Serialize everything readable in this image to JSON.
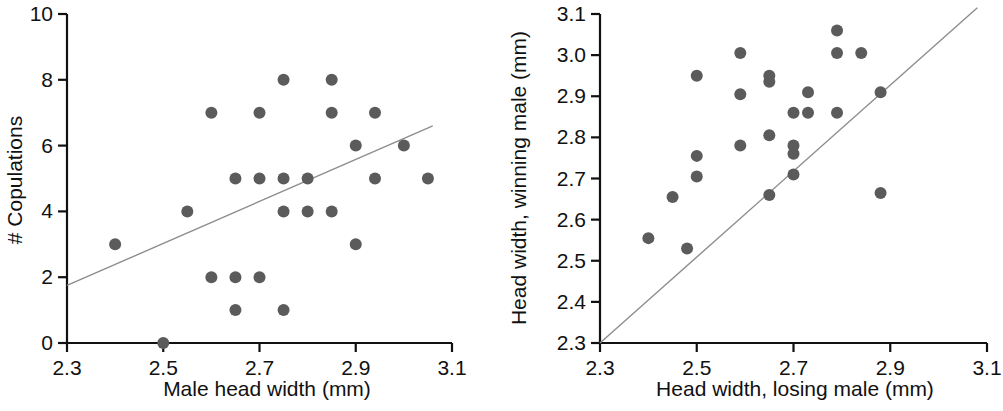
{
  "figure": {
    "background": "#ffffff",
    "marker_color": "#5b5b5b",
    "line_color": "#8d8d8d",
    "axis_color": "#111111",
    "panel_count": 2
  },
  "chart_data": [
    {
      "type": "scatter",
      "panel": "left",
      "title": "",
      "xlabel": "Male head width (mm)",
      "ylabel": "# Copulations",
      "xlim": [
        2.3,
        3.1
      ],
      "ylim": [
        0,
        10
      ],
      "xticks": [
        2.3,
        2.5,
        2.7,
        2.9,
        3.1
      ],
      "xticklabels": [
        "2.3",
        "2.5",
        "2.7",
        "2.9",
        "3.1"
      ],
      "yticks": [
        0,
        2,
        4,
        6,
        8,
        10
      ],
      "yticklabels": [
        "0",
        "2",
        "4",
        "6",
        "8",
        "10"
      ],
      "grid": false,
      "legend": null,
      "points": [
        {
          "x": 2.4,
          "y": 3
        },
        {
          "x": 2.5,
          "y": 0
        },
        {
          "x": 2.55,
          "y": 4
        },
        {
          "x": 2.6,
          "y": 7
        },
        {
          "x": 2.6,
          "y": 2
        },
        {
          "x": 2.65,
          "y": 5
        },
        {
          "x": 2.65,
          "y": 2
        },
        {
          "x": 2.65,
          "y": 1
        },
        {
          "x": 2.7,
          "y": 7
        },
        {
          "x": 2.7,
          "y": 5
        },
        {
          "x": 2.7,
          "y": 2
        },
        {
          "x": 2.75,
          "y": 8
        },
        {
          "x": 2.75,
          "y": 5
        },
        {
          "x": 2.75,
          "y": 4
        },
        {
          "x": 2.75,
          "y": 1
        },
        {
          "x": 2.8,
          "y": 5
        },
        {
          "x": 2.8,
          "y": 4
        },
        {
          "x": 2.85,
          "y": 8
        },
        {
          "x": 2.85,
          "y": 7
        },
        {
          "x": 2.85,
          "y": 4
        },
        {
          "x": 2.9,
          "y": 6
        },
        {
          "x": 2.9,
          "y": 3
        },
        {
          "x": 2.94,
          "y": 7
        },
        {
          "x": 2.94,
          "y": 5
        },
        {
          "x": 3.0,
          "y": 6
        },
        {
          "x": 3.05,
          "y": 5
        }
      ],
      "fit_line": {
        "x1": 2.3,
        "y1": 1.75,
        "x2": 3.06,
        "y2": 6.6
      }
    },
    {
      "type": "scatter",
      "panel": "right",
      "title": "",
      "xlabel": "Head width, losing male (mm)",
      "ylabel": "Head width, winning male (mm)",
      "xlim": [
        2.3,
        3.1
      ],
      "ylim": [
        2.3,
        3.1
      ],
      "xticks": [
        2.3,
        2.5,
        2.7,
        2.9,
        3.1
      ],
      "xticklabels": [
        "2.3",
        "2.5",
        "2.7",
        "2.9",
        "3.1"
      ],
      "yticks": [
        2.3,
        2.4,
        2.5,
        2.6,
        2.7,
        2.8,
        2.9,
        3.0,
        3.1
      ],
      "yticklabels": [
        "2.3",
        "2.4",
        "2.5",
        "2.6",
        "2.7",
        "2.8",
        "2.9",
        "3.0",
        "3.1"
      ],
      "grid": false,
      "legend": null,
      "points": [
        {
          "x": 2.4,
          "y": 2.555
        },
        {
          "x": 2.45,
          "y": 2.655
        },
        {
          "x": 2.48,
          "y": 2.53
        },
        {
          "x": 2.5,
          "y": 2.95
        },
        {
          "x": 2.5,
          "y": 2.755
        },
        {
          "x": 2.5,
          "y": 2.705
        },
        {
          "x": 2.59,
          "y": 3.005
        },
        {
          "x": 2.59,
          "y": 2.905
        },
        {
          "x": 2.59,
          "y": 2.78
        },
        {
          "x": 2.65,
          "y": 2.95
        },
        {
          "x": 2.65,
          "y": 2.935
        },
        {
          "x": 2.65,
          "y": 2.805
        },
        {
          "x": 2.65,
          "y": 2.66
        },
        {
          "x": 2.7,
          "y": 2.86
        },
        {
          "x": 2.7,
          "y": 2.78
        },
        {
          "x": 2.7,
          "y": 2.76
        },
        {
          "x": 2.7,
          "y": 2.71
        },
        {
          "x": 2.73,
          "y": 2.91
        },
        {
          "x": 2.73,
          "y": 2.86
        },
        {
          "x": 2.79,
          "y": 3.06
        },
        {
          "x": 2.79,
          "y": 3.005
        },
        {
          "x": 2.79,
          "y": 2.86
        },
        {
          "x": 2.84,
          "y": 3.005
        },
        {
          "x": 2.88,
          "y": 2.91
        },
        {
          "x": 2.88,
          "y": 2.665
        }
      ],
      "fit_line": {
        "x1": 2.3,
        "y1": 2.3,
        "x2": 3.08,
        "y2": 3.115
      }
    }
  ]
}
